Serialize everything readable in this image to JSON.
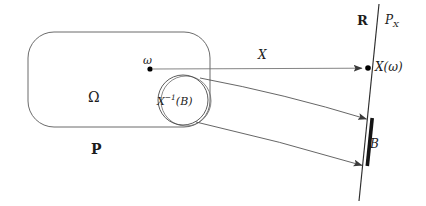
{
  "figure": {
    "type": "math-diagram",
    "background_color": "#ffffff",
    "stroke_color": "#3a3a3a",
    "text_color": "#1c1c1c",
    "accent_color": "#000000"
  },
  "labels": {
    "omega_point": "ω",
    "omega_set": "Ω",
    "probability_measure": "P",
    "preimage_base": "X",
    "preimage_exponent": "−1",
    "preimage_argument": "(B)",
    "map": "X",
    "reals": "R",
    "pushforward_base": "P",
    "pushforward_subscript": "X",
    "image_point": "X(ω)",
    "borel_set": "B"
  },
  "geometry": {
    "sample_space_rect": {
      "x": 28,
      "y": 32,
      "width": 182,
      "height": 95,
      "radius": 26
    },
    "preimage_circle": {
      "cx": 183,
      "cy": 100,
      "r": 25
    },
    "preimage_circle_shadow": {
      "cx": 186,
      "cy": 101,
      "r": 25
    },
    "omega_dot": {
      "cx": 150,
      "cy": 69,
      "r": 2.6
    },
    "image_dot": {
      "cx": 368,
      "cy": 68,
      "r": 2.8
    },
    "real_line": {
      "x1": 379,
      "y1": 4,
      "x2": 359,
      "y2": 201
    },
    "borel_segment": {
      "x1": 372,
      "y1": 118,
      "x2": 367,
      "y2": 166,
      "width": 3.4
    },
    "arrow_map": {
      "x1": 152,
      "y1": 69,
      "x2": 364,
      "y2": 68
    },
    "arrow_upper": {
      "x1": 200,
      "y1": 78,
      "x2": 369,
      "y2": 120,
      "cx": 285,
      "cy": 95
    },
    "arrow_lower": {
      "x1": 196,
      "y1": 122,
      "x2": 364,
      "y2": 166,
      "cx": 280,
      "cy": 141
    }
  }
}
